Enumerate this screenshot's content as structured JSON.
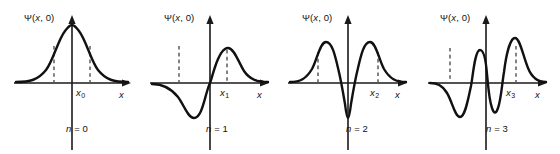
{
  "figure": {
    "background_color": "#ffffff",
    "curve_color": "#111111",
    "axis_color": "#1a1a1a",
    "dash_color": "#2a2a2a"
  },
  "chart_data": {
    "type": "line",
    "title": "",
    "xlabel": "x",
    "ylabel": "Ψ(x, 0)",
    "grid": false,
    "legend": false,
    "panel_count": 4,
    "panels": [
      {
        "index": 0,
        "quantum_number_label": "n = 0",
        "quantum_number": 0,
        "y_axis_label": "Ψ(x, 0)",
        "x_axis_label": "x",
        "x_marker_label": "x",
        "x_marker_subscript": "0",
        "nodes": 0,
        "parity": "even",
        "lobes": [
          {
            "sign": "positive",
            "peak_x": 0.0,
            "peak_y": 1.0
          }
        ],
        "dashed_markers_x": [
          -0.72,
          0.72
        ],
        "x": [
          -3.0,
          -2.6,
          -2.2,
          -1.8,
          -1.4,
          -1.0,
          -0.6,
          -0.2,
          0.0,
          0.2,
          0.6,
          1.0,
          1.4,
          1.8,
          2.2,
          2.6,
          3.0
        ],
        "y": [
          0.01,
          0.03,
          0.09,
          0.2,
          0.38,
          0.61,
          0.84,
          0.98,
          1.0,
          0.98,
          0.84,
          0.61,
          0.38,
          0.2,
          0.09,
          0.03,
          0.01
        ]
      },
      {
        "index": 1,
        "quantum_number_label": "n = 1",
        "quantum_number": 1,
        "y_axis_label": "Ψ(x, 0)",
        "x_axis_label": "x",
        "x_marker_label": "x",
        "x_marker_subscript": "1",
        "nodes": 1,
        "parity": "odd",
        "lobes": [
          {
            "sign": "negative",
            "peak_x": -0.85,
            "peak_y": -0.92
          },
          {
            "sign": "positive",
            "peak_x": 0.85,
            "peak_y": 0.92
          }
        ],
        "dashed_markers_x": [
          -1.55,
          0.9
        ],
        "x": [
          -3.0,
          -2.5,
          -2.0,
          -1.6,
          -1.2,
          -0.85,
          -0.5,
          -0.2,
          0.0,
          0.2,
          0.5,
          0.85,
          1.2,
          1.6,
          2.0,
          2.5,
          3.0
        ],
        "y": [
          -0.02,
          -0.08,
          -0.27,
          -0.55,
          -0.83,
          -0.92,
          -0.7,
          -0.32,
          0.0,
          0.32,
          0.7,
          0.92,
          0.83,
          0.55,
          0.27,
          0.08,
          0.02
        ]
      },
      {
        "index": 2,
        "quantum_number_label": "n = 2",
        "quantum_number": 2,
        "y_axis_label": "Ψ(x, 0)",
        "x_axis_label": "x",
        "x_marker_label": "x",
        "x_marker_subscript": "2",
        "nodes": 2,
        "parity": "even",
        "lobes": [
          {
            "sign": "positive",
            "peak_x": -1.15,
            "peak_y": 0.86
          },
          {
            "sign": "negative",
            "peak_x": 0.0,
            "peak_y": -1.0
          },
          {
            "sign": "positive",
            "peak_x": 1.15,
            "peak_y": 0.86
          }
        ],
        "dashed_markers_x": [
          -1.65,
          1.65
        ],
        "x": [
          -3.0,
          -2.5,
          -2.0,
          -1.6,
          -1.15,
          -0.8,
          -0.5,
          -0.25,
          0.0,
          0.25,
          0.5,
          0.8,
          1.15,
          1.6,
          2.0,
          2.5,
          3.0
        ],
        "y": [
          0.02,
          0.1,
          0.35,
          0.68,
          0.86,
          0.6,
          0.1,
          -0.6,
          -1.0,
          -0.6,
          0.1,
          0.6,
          0.86,
          0.68,
          0.35,
          0.1,
          0.02
        ]
      },
      {
        "index": 3,
        "quantum_number_label": "n = 3",
        "quantum_number": 3,
        "y_axis_label": "Ψ(x, 0)",
        "x_axis_label": "x",
        "x_marker_label": "x",
        "x_marker_subscript": "3",
        "nodes": 3,
        "parity": "odd",
        "lobes": [
          {
            "sign": "negative",
            "peak_x": -1.45,
            "peak_y": -0.88
          },
          {
            "sign": "positive",
            "peak_x": -0.5,
            "peak_y": 0.72
          },
          {
            "sign": "negative",
            "peak_x": 0.5,
            "peak_y": -0.72
          },
          {
            "sign": "positive",
            "peak_x": 1.45,
            "peak_y": 0.95
          }
        ],
        "dashed_markers_x": [
          -1.95,
          1.55
        ],
        "x": [
          -3.0,
          -2.5,
          -2.1,
          -1.75,
          -1.45,
          -1.1,
          -0.8,
          -0.5,
          -0.25,
          0.0,
          0.25,
          0.5,
          0.8,
          1.1,
          1.45,
          1.8,
          2.2,
          2.6,
          3.0
        ],
        "y": [
          -0.02,
          -0.12,
          -0.38,
          -0.72,
          -0.88,
          -0.5,
          0.25,
          0.72,
          0.55,
          0.0,
          -0.55,
          -0.72,
          -0.25,
          0.5,
          0.95,
          0.7,
          0.3,
          0.08,
          0.02
        ]
      }
    ]
  }
}
